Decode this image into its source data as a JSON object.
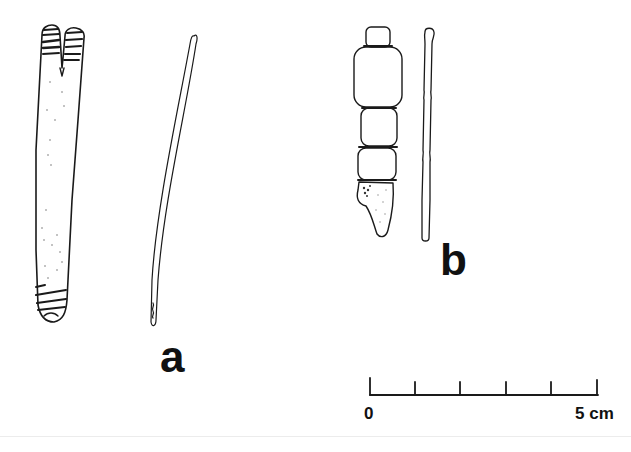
{
  "figure": {
    "labels": {
      "a": "a",
      "b": "b"
    },
    "scale_bar": {
      "start_label": "0",
      "end_label": "5 cm",
      "divisions": 5
    },
    "artifacts": [
      {
        "id": "a-left",
        "description": "flat elongated bone/antler tool with notched top and incised bands"
      },
      {
        "id": "a-right",
        "description": "thin curved needle/awl, side view"
      },
      {
        "id": "b-left",
        "description": "segmented object with four rounded segments and broken base"
      },
      {
        "id": "b-right",
        "description": "thin rod, side view"
      }
    ],
    "colors": {
      "ink": "#1a1a1a",
      "background": "#ffffff"
    }
  }
}
